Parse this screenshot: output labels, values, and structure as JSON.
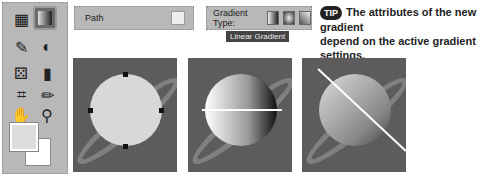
{
  "toolbox": {
    "tools": [
      "artboard",
      "gradient",
      "eyedropper",
      "3d",
      "pattern",
      "chart",
      "crop",
      "pencil",
      "hand",
      "zoom"
    ]
  },
  "options_bar_path": {
    "label": "Path"
  },
  "options_bar_gradient": {
    "label": "Gradient Type:",
    "tooltip": "Linear Gradient"
  },
  "tip": {
    "badge": "TIP",
    "line1": "The attributes of the new gradient",
    "line2": "depend on the active gradient settings."
  },
  "colors": {
    "panel_bg": "#5c5c5c",
    "toolbox_bg": "#b8b8b8"
  }
}
